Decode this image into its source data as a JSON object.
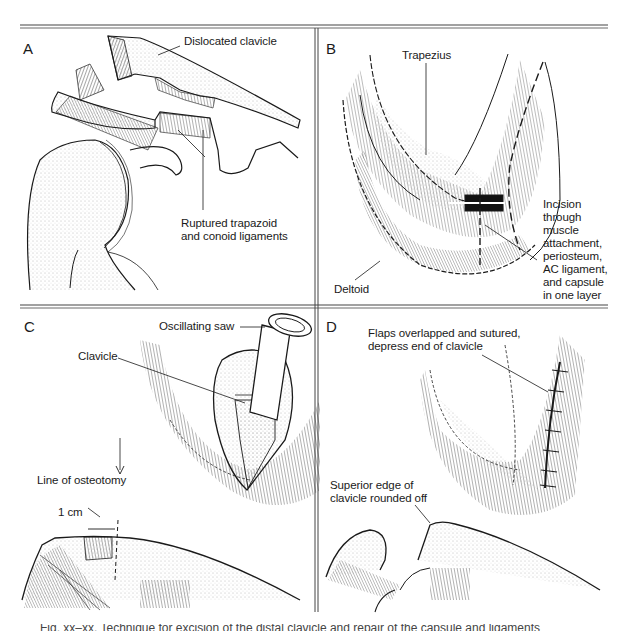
{
  "figure": {
    "panels": [
      {
        "letter": "A",
        "labels": {
          "dislocated_clavicle": "Dislocated clavicle",
          "ruptured_line1": "Ruptured trapazoid",
          "ruptured_line2": "and conoid ligaments"
        }
      },
      {
        "letter": "B",
        "labels": {
          "trapezius": "Trapezius",
          "deltoid": "Deltoid",
          "incision_lines": [
            "Incision",
            "through",
            "muscle",
            "attachment,",
            "periosteum,",
            "AC ligament,",
            "and capsule",
            "in one layer"
          ]
        }
      },
      {
        "letter": "C",
        "labels": {
          "oscillating_saw": "Oscillating saw",
          "clavicle": "Clavicle",
          "line_of_osteotomy": "Line of osteotomy",
          "one_cm": "1 cm"
        }
      },
      {
        "letter": "D",
        "labels": {
          "flaps_line1": "Flaps overlapped and sutured,",
          "flaps_line2": "depress end of clavicle",
          "superior_line1": "Superior edge of",
          "superior_line2": "clavicle rounded off"
        }
      }
    ],
    "caption_cutoff": "Fig. — (caption text cut off at bottom of image)"
  },
  "colors": {
    "ink": "#1a1a1a",
    "rule": "#555555",
    "background": "#ffffff"
  }
}
